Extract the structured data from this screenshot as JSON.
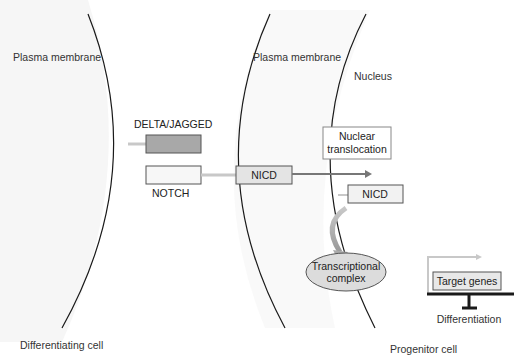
{
  "diagram": {
    "labels": {
      "plasma_membrane_left": "Plasma membrane",
      "plasma_membrane_right": "Plasma membrane",
      "nucleus": "Nucleus",
      "differentiating_cell": "Differentiating cell",
      "progenitor_cell": "Progenitor cell"
    },
    "nodes": {
      "delta_jagged": "DELTA/JAGGED",
      "notch": "NOTCH",
      "nicd_membrane": "NICD",
      "nuclear_translocation_line1": "Nuclear",
      "nuclear_translocation_line2": "translocation",
      "nicd_nucleus": "NICD",
      "transcriptional_complex_line1": "Transcriptional",
      "transcriptional_complex_line2": "complex",
      "target_genes": "Target genes",
      "differentiation": "Differentiation"
    },
    "colors": {
      "delta_fill": "#a8a8a8",
      "notch_fill": "#f7f7f7",
      "nicd_fill": "#e4e4e4",
      "complex_fill": "#dcdcdc",
      "target_fill": "#e8e8e8",
      "connector": "#c8c8c8",
      "arrow": "#777777",
      "membrane": "#1a1a1a"
    }
  }
}
